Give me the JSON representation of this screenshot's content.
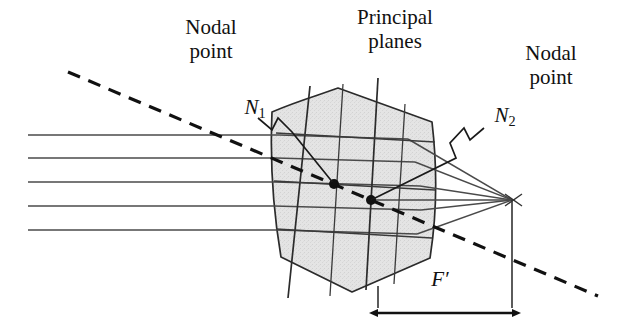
{
  "figure": {
    "width": 625,
    "height": 333,
    "background": "#ffffff"
  },
  "labels": {
    "nodal_point_left": "Nodal\npoint",
    "principal_planes": "Principal\nplanes",
    "nodal_point_right": "Nodal\npoint",
    "n1": "N",
    "n1_sub": "1",
    "n2": "N",
    "n2_sub": "2",
    "focal_distance": "F′"
  },
  "colors": {
    "ink": "#111111",
    "line": "#3a3a3a",
    "lens_fill": "#e4e4e4",
    "lens_stroke": "#2b2b2b",
    "dashed": "#111111",
    "background": "#ffffff"
  },
  "geometry": {
    "incoming_rays_y": [
      135,
      158,
      182,
      206,
      230
    ],
    "ray_start_x": 28,
    "nodal_point_1": {
      "x": 334,
      "y": 184
    },
    "nodal_point_2": {
      "x": 371,
      "y": 200
    },
    "focal_point": {
      "x": 512,
      "y": 200
    },
    "dashed_line": {
      "x1": 68,
      "y1": 72,
      "x2": 598,
      "y2": 296
    },
    "focal_dimension": {
      "x1": 378,
      "x2": 512,
      "y": 313
    },
    "lens_left_edge_x": 272,
    "lens_right_edge_x": 433
  }
}
